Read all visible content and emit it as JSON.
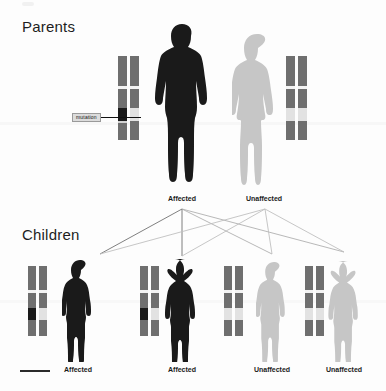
{
  "diagram": {
    "title_parents": "Parents",
    "title_children": "Children",
    "mutation_label": "mutation"
  },
  "colors": {
    "affected_silhouette": "#1a1a1a",
    "unaffected_silhouette": "#c6c6c6",
    "chromosome_body": "#6f6f6f",
    "chromosome_band_light": "#e2e2e2",
    "mutation_band": "#1a1a1a",
    "background": "#fdfdfd",
    "line_dark": "#555555",
    "line_light": "#bdbdbd"
  },
  "parents": [
    {
      "id": "father",
      "sex": "male",
      "status": "Affected",
      "caption": "Affected",
      "silhouette_tone": "dark",
      "chromosomes": [
        {
          "copy": "maternal",
          "has_mutation": true
        },
        {
          "copy": "paternal",
          "has_mutation": false
        }
      ]
    },
    {
      "id": "mother",
      "sex": "female",
      "status": "Unaffected",
      "caption": "Unaffected",
      "silhouette_tone": "light",
      "chromosomes": [
        {
          "copy": "maternal",
          "has_mutation": false
        },
        {
          "copy": "paternal",
          "has_mutation": false
        }
      ]
    }
  ],
  "children": [
    {
      "id": "child1",
      "sex": "male",
      "status": "Affected",
      "caption": "Affected",
      "silhouette_tone": "dark",
      "chromosomes": [
        {
          "copy": "paternal",
          "has_mutation": true
        },
        {
          "copy": "maternal",
          "has_mutation": false
        }
      ]
    },
    {
      "id": "child2",
      "sex": "female",
      "status": "Affected",
      "caption": "Affected",
      "silhouette_tone": "dark",
      "chromosomes": [
        {
          "copy": "paternal",
          "has_mutation": true
        },
        {
          "copy": "maternal",
          "has_mutation": false
        }
      ]
    },
    {
      "id": "child3",
      "sex": "male",
      "status": "Unaffected",
      "caption": "Unaffected",
      "silhouette_tone": "light",
      "chromosomes": [
        {
          "copy": "paternal",
          "has_mutation": false
        },
        {
          "copy": "maternal",
          "has_mutation": false
        }
      ]
    },
    {
      "id": "child4",
      "sex": "female",
      "status": "Unaffected",
      "caption": "Unaffected",
      "silhouette_tone": "light",
      "chromosomes": [
        {
          "copy": "paternal",
          "has_mutation": false
        },
        {
          "copy": "maternal",
          "has_mutation": false
        }
      ]
    }
  ]
}
